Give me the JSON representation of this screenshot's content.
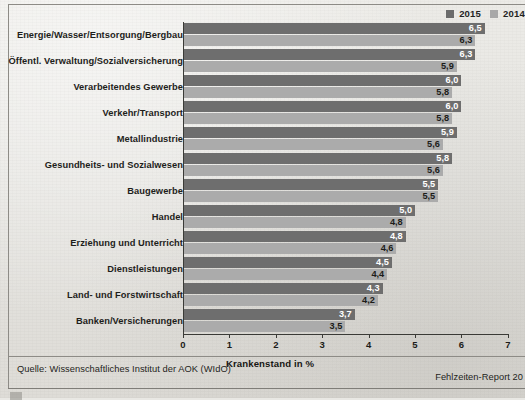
{
  "legend": {
    "items": [
      {
        "label": "2015",
        "color": "#6e6e6e"
      },
      {
        "label": "2014",
        "color": "#ababab"
      }
    ]
  },
  "footer": {
    "source": "Quelle: Wissenschaftliches Institut der AOK (WIdO)",
    "report": "Fehlzeiten-Report 20"
  },
  "chart_data": {
    "type": "bar",
    "orientation": "horizontal",
    "title": "",
    "xlabel": "Krankenstand in %",
    "ylabel": "",
    "xlim": [
      0,
      7
    ],
    "xticks": [
      "0",
      "1",
      "2",
      "3",
      "4",
      "5",
      "6",
      "7"
    ],
    "grid": false,
    "legend_position": "top-right",
    "categories": [
      "Energie/Wasser/Entsorgung/Bergbau",
      "Öffentl. Verwaltung/Sozialversicherung",
      "Verarbeitendes Gewerbe",
      "Verkehr/Transport",
      "Metallindustrie",
      "Gesundheits- und Sozialwesen",
      "Baugewerbe",
      "Handel",
      "Erziehung und Unterricht",
      "Dienstleistungen",
      "Land- und Forstwirtschaft",
      "Banken/Versicherungen"
    ],
    "series": [
      {
        "name": "2015",
        "color": "#6e6e6e",
        "values": [
          6.5,
          6.3,
          6.0,
          6.0,
          5.9,
          5.8,
          5.5,
          5.0,
          4.8,
          4.5,
          4.3,
          3.7
        ],
        "labels": [
          "6,5",
          "6,3",
          "6,0",
          "6,0",
          "5,9",
          "5,8",
          "5,5",
          "5,0",
          "4,8",
          "4,5",
          "4,3",
          "3,7"
        ]
      },
      {
        "name": "2014",
        "color": "#ababab",
        "values": [
          6.3,
          5.9,
          5.8,
          5.8,
          5.6,
          5.6,
          5.5,
          4.8,
          4.6,
          4.4,
          4.2,
          3.5
        ],
        "labels": [
          "6,3",
          "5,9",
          "5,8",
          "5,8",
          "5,6",
          "5,6",
          "5,5",
          "4,8",
          "4,6",
          "4,4",
          "4,2",
          "3,5"
        ]
      }
    ]
  }
}
